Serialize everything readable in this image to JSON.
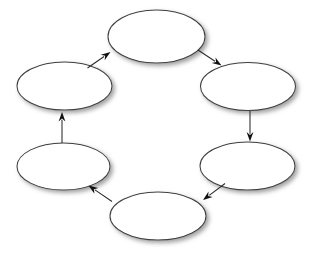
{
  "diagram": {
    "kind": "cycle-diagram",
    "title": "",
    "background_color": "#ffffff",
    "canvas": {
      "width": 312,
      "height": 253
    },
    "style": {
      "node_fill": "#ffffff",
      "node_stroke": "#3f3f3f",
      "node_stroke_width": 1.05,
      "node_shadow_color": "#9a9a9a",
      "node_shadow_dx": 2.5,
      "node_shadow_dy": 2.5,
      "node_shadow_blur": 2.0,
      "connector_stroke": "#2a2a2a",
      "connector_stroke_width": 1.05,
      "arrowhead_fill": "#111111"
    },
    "node_count": 6,
    "arrow_count": 6,
    "direction": "clockwise",
    "nodes": [
      {
        "id": "node-top",
        "label": "",
        "cx": 156.5,
        "cy": 36.5,
        "rx": 48.5,
        "ry": 26.5
      },
      {
        "id": "node-upper-right",
        "label": "",
        "cx": 248.0,
        "cy": 86.5,
        "rx": 47.5,
        "ry": 24.0
      },
      {
        "id": "node-lower-right",
        "label": "",
        "cx": 247.5,
        "cy": 166.0,
        "rx": 47.5,
        "ry": 24.0
      },
      {
        "id": "node-bottom",
        "label": "",
        "cx": 158.0,
        "cy": 216.0,
        "rx": 48.0,
        "ry": 24.0
      },
      {
        "id": "node-lower-left",
        "label": "",
        "cx": 63.5,
        "cy": 166.5,
        "rx": 46.5,
        "ry": 23.5
      },
      {
        "id": "node-upper-left",
        "label": "",
        "cx": 64.5,
        "cy": 86.0,
        "rx": 47.5,
        "ry": 24.0
      }
    ],
    "arrows": [
      {
        "id": "arrow-top-to-upper-right",
        "from": "node-top",
        "to": "node-upper-right",
        "label": "",
        "x1": 198.0,
        "y1": 50.0,
        "x2": 221.5,
        "y2": 65.5,
        "head_angle_deg": 33.4
      },
      {
        "id": "arrow-upper-right-to-lower-right",
        "from": "node-upper-right",
        "to": "node-lower-right",
        "label": "",
        "x1": 250.0,
        "y1": 111.0,
        "x2": 250.0,
        "y2": 141.5,
        "head_angle_deg": 90.0
      },
      {
        "id": "arrow-lower-right-to-bottom",
        "from": "node-lower-right",
        "to": "node-bottom",
        "label": "",
        "x1": 225.0,
        "y1": 183.5,
        "x2": 203.0,
        "y2": 200.0,
        "head_angle_deg": 143.1
      },
      {
        "id": "arrow-bottom-to-lower-left",
        "from": "node-bottom",
        "to": "node-lower-left",
        "label": "",
        "x1": 112.0,
        "y1": 201.5,
        "x2": 88.5,
        "y2": 185.5,
        "head_angle_deg": 214.3
      },
      {
        "id": "arrow-lower-left-to-upper-left",
        "from": "node-lower-left",
        "to": "node-upper-left",
        "label": "",
        "x1": 62.0,
        "y1": 143.0,
        "x2": 62.0,
        "y2": 112.0,
        "head_angle_deg": 270.0
      },
      {
        "id": "arrow-upper-left-to-top",
        "from": "node-upper-left",
        "to": "node-top",
        "label": "",
        "x1": 87.5,
        "y1": 68.0,
        "x2": 110.5,
        "y2": 52.0,
        "head_angle_deg": 325.2
      }
    ]
  }
}
